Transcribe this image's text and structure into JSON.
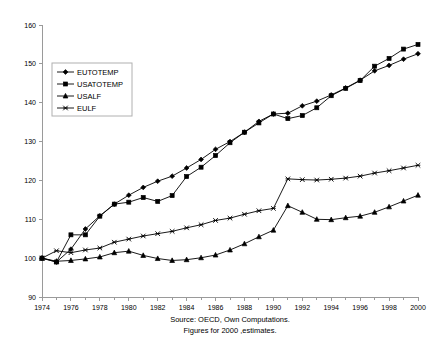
{
  "chart_data": {
    "type": "line",
    "title": "",
    "xlabel": "",
    "ylabel": "",
    "xlim": [
      1974,
      2000
    ],
    "ylim": [
      90,
      160
    ],
    "y_ticks": [
      90,
      100,
      110,
      120,
      130,
      140,
      150,
      160
    ],
    "x_ticks": [
      1974,
      1976,
      1978,
      1980,
      1982,
      1984,
      1986,
      1988,
      1990,
      1992,
      1994,
      1996,
      1998,
      2000
    ],
    "x_minor_ticks": [
      1975,
      1977,
      1979,
      1981,
      1983,
      1985,
      1987,
      1989,
      1991,
      1993,
      1995,
      1997,
      1999
    ],
    "grid": false,
    "legend_position": "upper-left",
    "x": [
      1974,
      1975,
      1976,
      1977,
      1978,
      1979,
      1980,
      1981,
      1982,
      1983,
      1984,
      1985,
      1986,
      1987,
      1988,
      1989,
      1990,
      1991,
      1992,
      1993,
      1994,
      1995,
      1996,
      1997,
      1998,
      1999,
      2000
    ],
    "series": [
      {
        "name": "EUTOTEMP",
        "marker": "diamond",
        "values": [
          100.0,
          99.0,
          102.3,
          107.5,
          110.9,
          113.9,
          116.2,
          118.2,
          119.8,
          121.1,
          123.2,
          125.4,
          128.0,
          130.0,
          132.4,
          135.2,
          137.1,
          137.3,
          139.2,
          140.4,
          142.0,
          143.8,
          145.8,
          148.2,
          149.6,
          151.2,
          152.6
        ]
      },
      {
        "name": "USATOTEMP",
        "marker": "square",
        "values": [
          100.0,
          99.0,
          106.0,
          106.0,
          110.8,
          113.9,
          114.4,
          115.6,
          114.6,
          116.1,
          121.0,
          123.4,
          126.4,
          129.7,
          132.4,
          134.8,
          137.1,
          135.9,
          136.7,
          138.7,
          141.8,
          143.7,
          145.7,
          149.4,
          151.4,
          153.8,
          155.0
        ]
      },
      {
        "name": "USALF",
        "marker": "triangle",
        "values": [
          100.0,
          99.2,
          99.4,
          99.8,
          100.3,
          101.4,
          101.8,
          100.7,
          99.9,
          99.4,
          99.6,
          100.1,
          100.8,
          102.1,
          103.7,
          105.5,
          107.2,
          113.5,
          111.8,
          110.0,
          109.9,
          110.4,
          110.8,
          111.8,
          113.2,
          114.7,
          116.2
        ]
      },
      {
        "name": "EULF",
        "marker": "cross",
        "values": [
          100.0,
          101.9,
          101.4,
          102.1,
          102.6,
          104.1,
          104.9,
          105.7,
          106.3,
          106.9,
          107.8,
          108.6,
          109.7,
          110.3,
          111.3,
          112.2,
          112.8,
          120.4,
          120.2,
          120.1,
          120.3,
          120.6,
          121.1,
          121.9,
          122.5,
          123.2,
          123.9
        ]
      }
    ],
    "caption_lines": [
      "Source: OECD, Own Computations.",
      "Figures for 2000 ,estimates."
    ]
  },
  "legend": {
    "entries": [
      "EUTOTEMP",
      "USATOTEMP",
      "USALF",
      "EULF"
    ]
  },
  "colors": {
    "series": "#000000",
    "axis": "#9a9a9a",
    "background": "#ffffff"
  }
}
